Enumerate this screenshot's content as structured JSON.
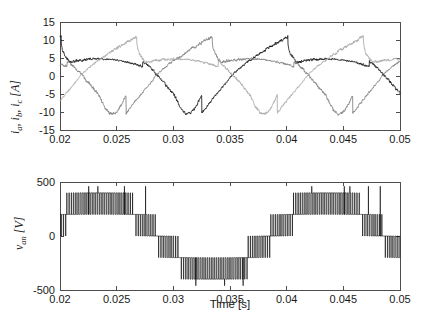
{
  "figure": {
    "background": "#ffffff",
    "width": 422,
    "height": 330
  },
  "chart_data": [
    {
      "id": "currents",
      "type": "line",
      "title": "",
      "xlabel": "",
      "ylabel": "i_a, i_b, i_c [A]",
      "ylabel_parts": {
        "v1": "i",
        "s1": "a",
        "sep1": ", ",
        "v2": "i",
        "s2": "b",
        "sep2": ", ",
        "v3": "i",
        "s3": "c",
        "unit": " [A]"
      },
      "xlim": [
        0.02,
        0.05
      ],
      "ylim": [
        -15,
        15
      ],
      "xticks": [
        0.02,
        0.025,
        0.03,
        0.035,
        0.04,
        0.045,
        0.05
      ],
      "xticklabels": [
        "0.02",
        "0.025",
        "0.03",
        "0.035",
        "0.04",
        "0.045",
        "0.05"
      ],
      "yticks": [
        15,
        10,
        5,
        0,
        -5,
        -10,
        -15
      ],
      "yticklabels": [
        "15",
        "10",
        "5",
        "0",
        "-5",
        "-10",
        "-15"
      ],
      "grid": false,
      "legend": "none",
      "noise_amplitude": 0.38,
      "fundamental_hz": 50,
      "series": [
        {
          "name": "i_a",
          "color": "#1a1a1a",
          "phase_deg": 0,
          "peak": 11.0,
          "waveform": "distorted-trapezoid",
          "description": "dark trace rising from -1 A at 0.02 s to +11 A peak near 0.025 s then dropping sharply"
        },
        {
          "name": "i_b",
          "color": "#7d7d7d",
          "phase_deg": -120,
          "peak": 11.0,
          "waveform": "distorted-trapezoid",
          "description": "mid-gray trace peaking near +9 A at 0.021 s falling to -5 A plateau"
        },
        {
          "name": "i_c",
          "color": "#a8a8a8",
          "phase_deg": 120,
          "peak": 11.0,
          "waveform": "distorted-trapezoid",
          "description": "light-gray trace at -5 A near 0.02 s dipping to -10.5 A plateau then rising"
        }
      ]
    },
    {
      "id": "voltage",
      "type": "line",
      "title": "",
      "xlabel": "Time [s]",
      "ylabel": "v_an [V]",
      "ylabel_parts": {
        "v": "v",
        "s": "an",
        "unit": " [V]"
      },
      "xlim": [
        0.02,
        0.05
      ],
      "ylim": [
        -500,
        500
      ],
      "xticks": [
        0.02,
        0.025,
        0.03,
        0.035,
        0.04,
        0.045,
        0.05
      ],
      "xticklabels": [
        "0.02",
        "0.025",
        "0.03",
        "0.035",
        "0.04",
        "0.045",
        "0.05"
      ],
      "yticks": [
        500,
        0,
        -500
      ],
      "yticklabels": [
        "500",
        "0",
        "-500"
      ],
      "grid": false,
      "legend": "none",
      "series": [
        {
          "name": "v_an",
          "color": "#000000",
          "waveform": "multilevel-pwm",
          "levels": [
            -400,
            -200,
            0,
            200,
            400
          ],
          "switching_hz": 5000,
          "fundamental_hz": 50,
          "modulation_index": 0.85,
          "description": "dense multilevel PWM phase voltage switching between 0, +/-200 V and +/-400 V with occasional excursions to +/-460 V"
        }
      ]
    }
  ]
}
